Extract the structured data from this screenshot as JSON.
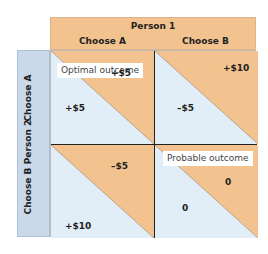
{
  "header": {
    "player_top": "Person 1",
    "col_a": "Choose A",
    "col_b": "Choose B"
  },
  "side": {
    "player_left": "Person 2",
    "row_a": "Choose A",
    "row_b": "Choose B"
  },
  "cells": {
    "aa": {
      "p1": "+$5",
      "p2": "+$5",
      "note": "Optimal outcome"
    },
    "ab": {
      "p1": "+$10",
      "p2": "–$5"
    },
    "ba": {
      "p1": "–$5",
      "p2": "+$10"
    },
    "bb": {
      "p1": "0",
      "p2": "0",
      "note": "Probable outcome"
    }
  },
  "colors": {
    "person1": "#f3c38f",
    "person2": "#e2eef7",
    "side_header": "#c9d9ea"
  }
}
